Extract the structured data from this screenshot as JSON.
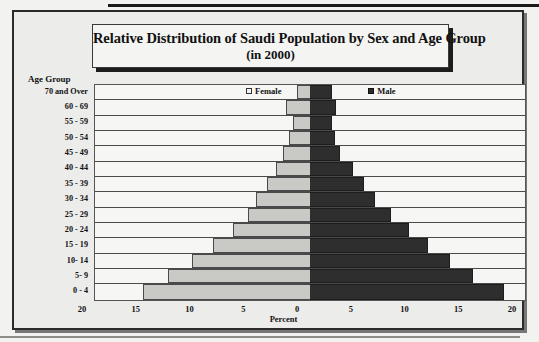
{
  "figure": {
    "title_line1": "Relative Distribution of Saudi Population by Sex and Age Group",
    "title_line2": "(in 2000)",
    "age_group_heading": "Age Group",
    "xaxis_title": "Percent"
  },
  "legend": {
    "female_label": "Female",
    "male_label": "Male",
    "female_swatch_icon": "legend-square-light-icon",
    "male_swatch_icon": "legend-square-dark-icon"
  },
  "colors": {
    "female_fill": "#c9c9c6",
    "male_fill": "#2e2e2e",
    "plot_background": "#f6f6f4",
    "frame": "#2b2b2b",
    "text": "#111111"
  },
  "chart_data": {
    "type": "bar",
    "subtype": "population-pyramid",
    "title": "Relative Distribution of Saudi Population by Sex and Age Group (in 2000)",
    "xlabel": "Percent",
    "ylabel": "Age Group",
    "orientation": "horizontal",
    "grid": false,
    "legend_position": "inside-top",
    "xlim": [
      -20,
      20
    ],
    "xticks": [
      20,
      15,
      10,
      5,
      0,
      5,
      10,
      15,
      20
    ],
    "xtick_values": [
      -20,
      -15,
      -10,
      -5,
      0,
      5,
      10,
      15,
      20
    ],
    "categories": [
      "70 and Over",
      "60 - 69",
      "55 - 59",
      "50 - 54",
      "45 - 49",
      "40 - 44",
      "35 - 39",
      "30 - 34",
      "25 - 29",
      "20 - 24",
      "15 - 19",
      "10- 14",
      "5- 9",
      "0 - 4"
    ],
    "series": [
      {
        "name": "Female",
        "side": "left",
        "values": [
          1.2,
          2.2,
          1.6,
          2.0,
          2.5,
          3.2,
          4.0,
          5.0,
          5.8,
          7.2,
          9.0,
          11.0,
          13.2,
          15.5
        ]
      },
      {
        "name": "Male",
        "side": "right",
        "values": [
          2.0,
          2.4,
          2.0,
          2.3,
          2.8,
          4.0,
          5.0,
          6.0,
          7.5,
          9.2,
          11.0,
          13.0,
          15.2,
          18.0
        ]
      }
    ]
  }
}
